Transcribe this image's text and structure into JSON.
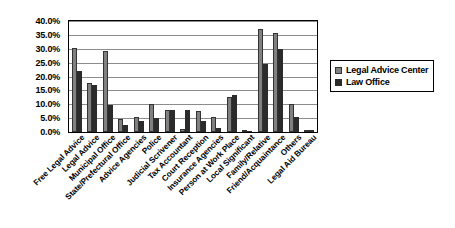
{
  "chart_data": {
    "type": "bar",
    "title": "",
    "subtitle": "",
    "xlabel": "",
    "ylabel": "",
    "ylim": [
      0,
      40
    ],
    "ytick_labels": [
      "0.0%",
      "5.0%",
      "10.0%",
      "15.0%",
      "20.0%",
      "25.0%",
      "30.0%",
      "35.0%",
      "40.0%"
    ],
    "ytick_values": [
      0,
      5,
      10,
      15,
      20,
      25,
      30,
      35,
      40
    ],
    "grid": true,
    "legend_position": "right",
    "categories": [
      "Free Legal Advice",
      "Legal Advice",
      "Municipal Office",
      "State/Prefectural Office",
      "Advice Agencies",
      "Police",
      "Judicial Scrivener",
      "Tax Accountant",
      "Court Reception",
      "Insurance Agencies",
      "Person at Work Place",
      "Local Significant",
      "Family/Relative",
      "Friend/Acquaintance",
      "Others",
      "Legal Aid Bureau"
    ],
    "series": [
      {
        "name": "Legal Advice Center",
        "color": "#808080",
        "values": [
          30.3,
          17.5,
          29.2,
          4.8,
          5.4,
          10.2,
          7.9,
          1.2,
          7.7,
          5.4,
          12.5,
          0.8,
          37.3,
          35.7,
          10.0,
          0.0
        ]
      },
      {
        "name": "Law Office",
        "color": "#2b2b2b",
        "values": [
          22.0,
          17.0,
          9.6,
          2.4,
          4.0,
          5.0,
          7.9,
          7.8,
          4.0,
          1.5,
          13.4,
          0.4,
          24.6,
          30.0,
          5.3,
          0.9
        ]
      }
    ]
  },
  "legend": {
    "items": [
      {
        "label": "Legal Advice Center"
      },
      {
        "label": "Law Office"
      }
    ]
  }
}
